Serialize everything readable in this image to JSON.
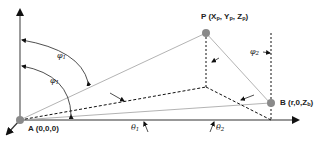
{
  "diagram": {
    "points": {
      "A": {
        "name": "A",
        "coords": "(0,0,0)"
      },
      "P": {
        "name": "P",
        "coords_prefix": "(X",
        "coords_sub1": "p",
        "coords_mid1": ", Y",
        "coords_sub2": "p",
        "coords_mid2": ", Z",
        "coords_sub3": "p",
        "coords_suffix": ")"
      },
      "B": {
        "name": "B",
        "coords_prefix": "(r,0,Z",
        "coords_sub": "b",
        "coords_suffix": ")"
      }
    },
    "angles": {
      "phi1_outer": {
        "symbol": "φ",
        "sub": "1"
      },
      "phi1_inner": {
        "symbol": "φ",
        "sub": "1"
      },
      "phi2": {
        "symbol": "φ",
        "sub": "2"
      },
      "theta1": {
        "symbol": "θ",
        "sub": "1"
      },
      "theta2": {
        "symbol": "θ",
        "sub": "2"
      }
    },
    "colors": {
      "axis": "#555555",
      "solid_line": "#999999",
      "dashed_line": "#111111",
      "point_fill": "#888888"
    }
  }
}
